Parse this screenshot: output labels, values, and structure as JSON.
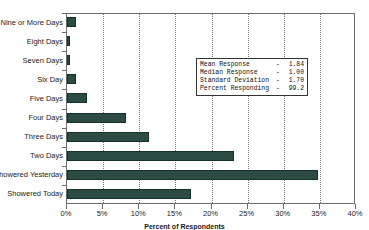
{
  "chart_data": {
    "type": "bar",
    "orientation": "horizontal",
    "title": "",
    "xlabel": "Percent of Respondents",
    "ylabel": "",
    "xlim": [
      0,
      40
    ],
    "xtick_labels": [
      "0%",
      "5%",
      "10%",
      "15%",
      "20%",
      "25%",
      "30%",
      "35%",
      "40%"
    ],
    "xtick_values": [
      0,
      5,
      10,
      15,
      20,
      25,
      30,
      35,
      40
    ],
    "grid": true,
    "grid_axis": "x",
    "legend": "none",
    "categories": [
      "Nine or More Days",
      "Eight Days",
      "Seven Days",
      "Six Day",
      "Five Days",
      "Four Days",
      "Three Days",
      "Two Days",
      "Showered Yesterday",
      "Showered Today"
    ],
    "values": [
      1.2,
      0.4,
      0.4,
      1.3,
      2.8,
      8.2,
      11.3,
      23.1,
      34.7,
      17.2
    ],
    "bar_color": "#2c4b43",
    "bar_edge_color": "#14302a"
  },
  "stats_box": {
    "rows": [
      {
        "label": "Mean Response",
        "dash": "-",
        "value": "1.84"
      },
      {
        "label": "Median Response",
        "dash": "-",
        "value": "1.00"
      },
      {
        "label": "Standard Deviation",
        "dash": "-",
        "value": "1.70"
      },
      {
        "label": "Percent Responding",
        "dash": "-",
        "value": "99.2"
      }
    ]
  },
  "title_remnant": ""
}
